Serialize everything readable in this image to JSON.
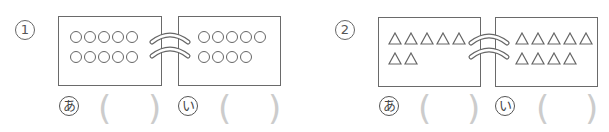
{
  "problems": [
    {
      "number": "1",
      "shape": "circle",
      "left_box": {
        "label": "あ",
        "rows": [
          5,
          5
        ]
      },
      "right_box": {
        "label": "い",
        "rows": [
          5,
          4
        ]
      }
    },
    {
      "number": "2",
      "shape": "triangle",
      "left_box": {
        "label": "あ",
        "rows": [
          5,
          2
        ]
      },
      "right_box": {
        "label": "い",
        "rows": [
          5,
          4
        ]
      }
    }
  ],
  "answer_blank": {
    "open": "(",
    "close": ")"
  },
  "colors": {
    "line": "#666666",
    "paren": "#cccccc"
  }
}
